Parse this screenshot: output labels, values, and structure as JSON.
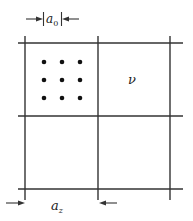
{
  "diagram": {
    "top_dimension": {
      "label": "a",
      "subscript": "0"
    },
    "bottom_dimension": {
      "label": "a",
      "subscript": "z"
    },
    "cell_label": "ν",
    "grid": {
      "rows": 2,
      "cols": 2
    },
    "dots": {
      "rows": 3,
      "cols": 3
    },
    "colors": {
      "line": "#333333",
      "dot": "#111111"
    }
  }
}
